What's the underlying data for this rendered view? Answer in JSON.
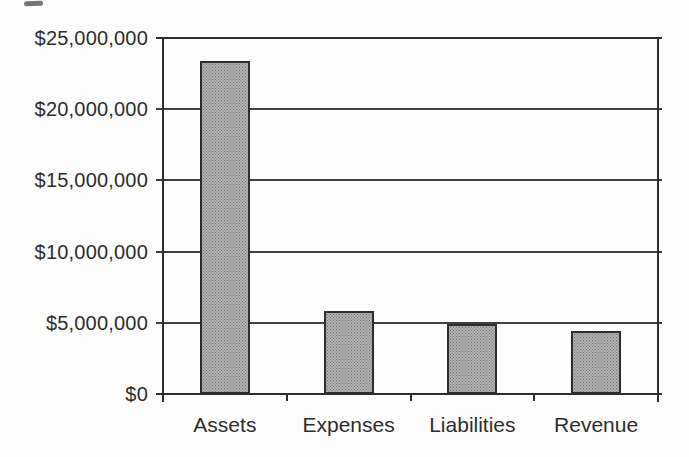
{
  "colors": {
    "background": "#fdfdfd",
    "text": "#2d2d2d",
    "axis": "#2d2d2d",
    "gridline": "#3f3f3f",
    "bar_fill_average": "#9a9a9a",
    "bar_border": "#2d2d2d"
  },
  "chart_data": {
    "type": "bar",
    "categories": [
      "Assets",
      "Expenses",
      "Liabilities",
      "Revenue"
    ],
    "values": [
      23400000,
      5800000,
      4900000,
      4400000
    ],
    "title": "",
    "xlabel": "",
    "ylabel": "",
    "ylim": [
      0,
      25000000
    ],
    "ytick_step": 5000000,
    "ytick_labels": [
      "$0",
      "$5,000,000",
      "$10,000,000",
      "$15,000,000",
      "$20,000,000",
      "$25,000,000"
    ],
    "grid": true,
    "legend": "none",
    "bar_width_px": 50
  }
}
